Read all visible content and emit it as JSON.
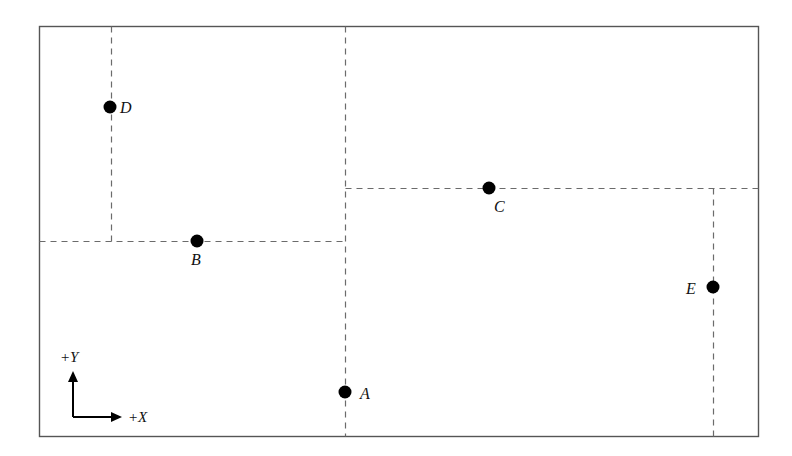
{
  "figure": {
    "background_color": "#ffffff",
    "frame": {
      "name": "plot-frame",
      "x": 39,
      "y": 26,
      "width": 719,
      "height": 410,
      "stroke_color": "#555555",
      "stroke_width": 1.4
    },
    "dash": {
      "color": "#6b6b6b",
      "width": 1.2,
      "pattern": "6,5"
    },
    "point_style": {
      "fill": "#000000",
      "radius": 6.5
    }
  },
  "axis_indicator": {
    "name": "axis-indicator",
    "origin_x": 73,
    "origin_y": 417,
    "y_arrow_tip_y": 371,
    "x_arrow_tip_x": 122,
    "stroke_color": "#000000",
    "stroke_width": 2,
    "y_label": "+Y",
    "y_label_x": 60,
    "y_label_y": 350,
    "x_label": "+X",
    "x_label_x": 128,
    "x_label_y": 410
  },
  "points": [
    {
      "id": "point-a",
      "label": "A",
      "x": 345,
      "y": 392,
      "label_x": 360,
      "label_y": 386
    },
    {
      "id": "point-b",
      "label": "B",
      "x": 197,
      "y": 241,
      "label_x": 191,
      "label_y": 252
    },
    {
      "id": "point-c",
      "label": "C",
      "x": 489,
      "y": 188,
      "label_x": 494,
      "label_y": 199
    },
    {
      "id": "point-d",
      "label": "D",
      "x": 110,
      "y": 107,
      "label_x": 120,
      "label_y": 100
    },
    {
      "id": "point-e",
      "label": "E",
      "x": 713,
      "y": 287,
      "label_x": 686,
      "label_y": 281
    }
  ],
  "dashed_lines": [
    {
      "id": "dashed-vertical-d",
      "orientation": "vertical",
      "x1": 111,
      "y1": 26,
      "x2": 111,
      "y2": 241
    },
    {
      "id": "dashed-horizontal-b",
      "orientation": "horizontal",
      "x1": 39,
      "y1": 241,
      "x2": 345,
      "y2": 241
    },
    {
      "id": "dashed-vertical-a",
      "orientation": "vertical",
      "x1": 345,
      "y1": 26,
      "x2": 345,
      "y2": 436
    },
    {
      "id": "dashed-horizontal-c",
      "orientation": "horizontal",
      "x1": 345,
      "y1": 188,
      "x2": 758,
      "y2": 188
    },
    {
      "id": "dashed-vertical-e",
      "orientation": "vertical",
      "x1": 713,
      "y1": 188,
      "x2": 713,
      "y2": 436
    }
  ],
  "chart_data": {
    "type": "scatter",
    "title": "",
    "xlabel": "+X",
    "ylabel": "+Y",
    "grid": false,
    "legend": null,
    "note": "Pixel coordinates measured from the top-left of the image; the drawing's own axes point right (+X) and up (+Y) from the lower-left indicator.",
    "series": [
      {
        "name": "labeled points",
        "points": [
          {
            "label": "A",
            "px": 345,
            "py": 392
          },
          {
            "label": "B",
            "px": 197,
            "py": 241
          },
          {
            "label": "C",
            "px": 489,
            "py": 188
          },
          {
            "label": "D",
            "px": 110,
            "py": 107
          },
          {
            "label": "E",
            "px": 713,
            "py": 287
          }
        ]
      }
    ],
    "annotations": [
      "dashed vertical through D down to B's horizontal",
      "dashed horizontal through B from left frame edge to A's vertical",
      "dashed vertical through A spanning full frame height",
      "dashed horizontal through C from A's vertical to right frame edge",
      "dashed vertical through E from C's horizontal down to bottom frame edge"
    ]
  }
}
